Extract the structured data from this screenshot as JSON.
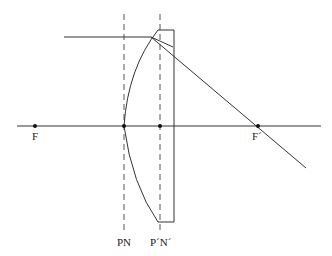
{
  "diagram": {
    "type": "thick lens principal planes ray diagram",
    "colors": {
      "line": "#333333",
      "background": "#ffffff"
    },
    "labels": {
      "front_focus": "F",
      "back_focus": "F´",
      "front_planes": "PN",
      "back_planes": "P´N´"
    },
    "elements": [
      "optical-axis",
      "front-focal-point",
      "back-focal-point",
      "front-principal-plane",
      "back-principal-plane",
      "plano-convex-lens",
      "incident-ray",
      "refracted-ray"
    ]
  }
}
